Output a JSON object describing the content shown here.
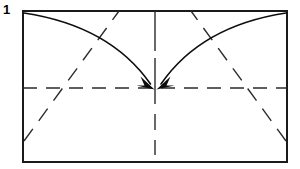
{
  "figure": {
    "step_number": "1",
    "canvas": {
      "width": 300,
      "height": 169
    },
    "colors": {
      "ink": "#1a1a1a",
      "paper": "#ffffff",
      "crease": "#2b2b2b"
    },
    "sheet": {
      "name": "paper-rectangle",
      "x": 23,
      "y": 11,
      "width": 264,
      "height": 151,
      "stroke_width": 2.0
    },
    "creases": [
      {
        "name": "horizontal-center-crease",
        "kind": "dashed",
        "x1": 23,
        "y1": 88,
        "x2": 287,
        "y2": 88,
        "dash": "14 9"
      },
      {
        "name": "vertical-center-crease-upper",
        "kind": "dashed",
        "x1": 155,
        "y1": 11,
        "x2": 155,
        "y2": 88,
        "dash": "40 7"
      },
      {
        "name": "vertical-center-crease-lower",
        "kind": "dashed",
        "x1": 155,
        "y1": 88,
        "x2": 155,
        "y2": 155,
        "dash": "16 10"
      },
      {
        "name": "diagonal-crease-left",
        "kind": "dashed",
        "x1": 24,
        "y1": 141,
        "x2": 119,
        "y2": 11,
        "dash": "15 10"
      },
      {
        "name": "diagonal-crease-right",
        "kind": "dashed",
        "x1": 286,
        "y1": 141,
        "x2": 191,
        "y2": 11,
        "dash": "15 10"
      }
    ],
    "arrows": [
      {
        "name": "fold-arrow-from-top-left",
        "kind": "curved-solid",
        "start": {
          "x": 24,
          "y": 13
        },
        "end": {
          "x": 152,
          "y": 86
        },
        "control": {
          "x": 110,
          "y": 26
        },
        "head": "solid-triangle"
      },
      {
        "name": "fold-arrow-from-top-right",
        "kind": "curved-solid",
        "start": {
          "x": 286,
          "y": 13
        },
        "end": {
          "x": 160,
          "y": 86
        },
        "control": {
          "x": 201,
          "y": 26
        },
        "head": "solid-triangle"
      }
    ],
    "center_point": {
      "x": 155,
      "y": 88
    }
  }
}
